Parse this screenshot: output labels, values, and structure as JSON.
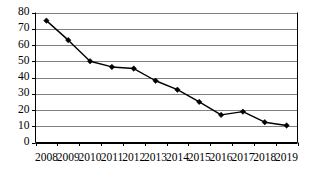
{
  "chart_data": {
    "type": "line",
    "title": "",
    "subtitle": "",
    "xlabel": "",
    "ylabel": "",
    "categories": [
      "2008",
      "2009",
      "2010",
      "2011",
      "2012",
      "2013",
      "2014",
      "2015",
      "2016",
      "2017",
      "2018",
      "2019"
    ],
    "values": [
      75,
      63,
      50,
      46.5,
      45.5,
      38,
      32.5,
      25,
      17,
      19,
      12.5,
      10.5
    ],
    "series": [
      {
        "name": "series-1",
        "values": [
          75,
          63,
          50,
          46.5,
          45.5,
          38,
          32.5,
          25,
          17,
          19,
          12.5,
          10.5
        ]
      }
    ],
    "ylim": [
      0,
      80
    ],
    "yticks": [
      0,
      10,
      20,
      30,
      40,
      50,
      60,
      70,
      80
    ],
    "ytick_labels": [
      "0",
      "10",
      "20",
      "30",
      "40",
      "50",
      "60",
      "70",
      "80"
    ],
    "xtick_labels": [
      "2008",
      "2009",
      "2010",
      "2011",
      "2012",
      "2013",
      "2014",
      "2015",
      "2016",
      "2017",
      "2018",
      "2019"
    ],
    "grid": "horizontal",
    "legend": "none",
    "colors": {
      "line": "#000000",
      "marker": "#000000",
      "grid": "#808080",
      "axis": "#000000",
      "background": "#ffffff"
    },
    "marker": "diamond",
    "annotations": []
  }
}
